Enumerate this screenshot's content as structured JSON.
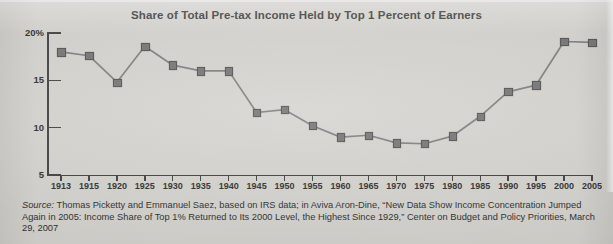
{
  "chart_data": {
    "type": "line",
    "title": "Share of Total Pre-tax Income Held by Top 1 Percent of Earners",
    "xlabel": "",
    "ylabel": "",
    "ylim": [
      5,
      20
    ],
    "ytick_labels": [
      "20%",
      "15",
      "10",
      "5"
    ],
    "ytick_values": [
      20,
      15,
      10,
      5
    ],
    "grid": false,
    "legend": "none",
    "marker": "square",
    "categories": [
      "1913",
      "1915",
      "1920",
      "1925",
      "1930",
      "1935",
      "1940",
      "1945",
      "1950",
      "1955",
      "1960",
      "1965",
      "1970",
      "1975",
      "1980",
      "1985",
      "1990",
      "1995",
      "2000",
      "2005"
    ],
    "x": [
      1913,
      1915,
      1920,
      1925,
      1930,
      1935,
      1940,
      1945,
      1950,
      1955,
      1960,
      1965,
      1970,
      1975,
      1980,
      1985,
      1990,
      1995,
      2000,
      2005
    ],
    "values": [
      18.0,
      17.6,
      14.8,
      18.6,
      16.6,
      16.0,
      16.0,
      11.6,
      11.9,
      10.2,
      9.0,
      9.2,
      8.4,
      8.3,
      9.1,
      11.2,
      13.8,
      14.5,
      19.1,
      19.0
    ],
    "series": [
      {
        "name": "Share of total pre-tax income held by top 1 percent of earners",
        "values": [
          18.0,
          17.6,
          14.8,
          18.6,
          16.6,
          16.0,
          16.0,
          11.6,
          11.9,
          10.2,
          9.0,
          9.2,
          8.4,
          8.3,
          9.1,
          11.2,
          13.8,
          14.5,
          19.1,
          19.0
        ]
      }
    ],
    "xlim": [
      1913,
      2005
    ],
    "units": "percent",
    "line_color": "#7a7a7a",
    "marker_color": "#6f6f6f",
    "axis_color": "#3a3a3a"
  },
  "source": {
    "label": "Source:",
    "line1_rest": " Thomas Picketty and Emmanuel Saez, based on IRS data; in Aviva Aron-Dine, “New Data Show Income",
    "line2": "Concentration Jumped Again in 2005: Income Share of Top 1% Returned to Its 2000 Level, the Highest Since 1929,”",
    "line3": "Center on Budget and Policy Priorities, March 29, 2007"
  },
  "colors": {
    "paper": "#d3d2cd",
    "ink": "#262626",
    "line": "#7a7a7a"
  }
}
